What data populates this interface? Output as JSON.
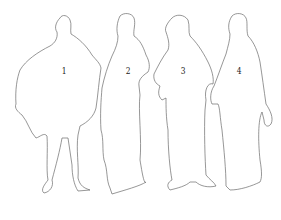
{
  "diagram": {
    "figures": [
      {
        "id": "1",
        "label": "1"
      },
      {
        "id": "2",
        "label": "2"
      },
      {
        "id": "3",
        "label": "3"
      },
      {
        "id": "4",
        "label": "4"
      }
    ],
    "colors": {
      "background": "#ffffff",
      "outline": "#6a6a6a",
      "label": "#222222"
    }
  }
}
